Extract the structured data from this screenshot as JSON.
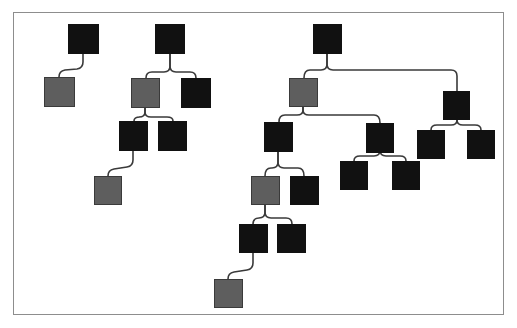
{
  "diagram": {
    "type": "tree-diagram",
    "frame": {
      "x": 13,
      "y": 12,
      "width": 491,
      "height": 303,
      "border_color": "#8d8d8d",
      "background": "#ffffff"
    },
    "colors": {
      "dark_node": "#111111",
      "gray_node": "#5e5e5e",
      "edge": "#3a3a3a",
      "canvas": "#ffffff"
    },
    "node_size": {
      "width": 30,
      "height": 30
    },
    "counts": {
      "total": 24,
      "dark": 19,
      "gray": 5,
      "trees": 3
    },
    "nodes": [
      {
        "id": "n1",
        "label": "",
        "kind": "dark",
        "x": 68,
        "y": 24,
        "w": 31,
        "h": 30,
        "tree": 1
      },
      {
        "id": "n2",
        "label": "",
        "kind": "gray",
        "x": 44,
        "y": 77,
        "w": 31,
        "h": 30,
        "tree": 1
      },
      {
        "id": "n3",
        "label": "",
        "kind": "dark",
        "x": 155,
        "y": 24,
        "w": 30,
        "h": 30,
        "tree": 2
      },
      {
        "id": "n4",
        "label": "",
        "kind": "gray",
        "x": 131,
        "y": 78,
        "w": 29,
        "h": 30,
        "tree": 2
      },
      {
        "id": "n5",
        "label": "",
        "kind": "dark",
        "x": 181,
        "y": 78,
        "w": 30,
        "h": 30,
        "tree": 2
      },
      {
        "id": "n6",
        "label": "",
        "kind": "dark",
        "x": 119,
        "y": 121,
        "w": 29,
        "h": 30,
        "tree": 2
      },
      {
        "id": "n7",
        "label": "",
        "kind": "dark",
        "x": 158,
        "y": 121,
        "w": 29,
        "h": 30,
        "tree": 2
      },
      {
        "id": "n8",
        "label": "",
        "kind": "gray",
        "x": 94,
        "y": 176,
        "w": 28,
        "h": 29,
        "tree": 2
      },
      {
        "id": "n9",
        "label": "",
        "kind": "dark",
        "x": 313,
        "y": 24,
        "w": 29,
        "h": 30,
        "tree": 3
      },
      {
        "id": "n10",
        "label": "",
        "kind": "gray",
        "x": 289,
        "y": 78,
        "w": 29,
        "h": 29,
        "tree": 3
      },
      {
        "id": "n11",
        "label": "",
        "kind": "dark",
        "x": 264,
        "y": 122,
        "w": 29,
        "h": 30,
        "tree": 3
      },
      {
        "id": "n12",
        "label": "",
        "kind": "gray",
        "x": 251,
        "y": 176,
        "w": 29,
        "h": 29,
        "tree": 3
      },
      {
        "id": "n13",
        "label": "",
        "kind": "dark",
        "x": 290,
        "y": 176,
        "w": 29,
        "h": 29,
        "tree": 3
      },
      {
        "id": "n14",
        "label": "",
        "kind": "dark",
        "x": 239,
        "y": 224,
        "w": 29,
        "h": 29,
        "tree": 3
      },
      {
        "id": "n15",
        "label": "",
        "kind": "dark",
        "x": 277,
        "y": 224,
        "w": 29,
        "h": 29,
        "tree": 3
      },
      {
        "id": "n16",
        "label": "",
        "kind": "gray",
        "x": 214,
        "y": 279,
        "w": 29,
        "h": 29,
        "tree": 3
      },
      {
        "id": "n17",
        "label": "",
        "kind": "dark",
        "x": 366,
        "y": 123,
        "w": 28,
        "h": 30,
        "tree": 3
      },
      {
        "id": "n18",
        "label": "",
        "kind": "dark",
        "x": 340,
        "y": 161,
        "w": 28,
        "h": 29,
        "tree": 3
      },
      {
        "id": "n19",
        "label": "",
        "kind": "dark",
        "x": 392,
        "y": 161,
        "w": 28,
        "h": 29,
        "tree": 3
      },
      {
        "id": "n20",
        "label": "",
        "kind": "dark",
        "x": 443,
        "y": 91,
        "w": 27,
        "h": 29,
        "tree": 3
      },
      {
        "id": "n21",
        "label": "",
        "kind": "dark",
        "x": 417,
        "y": 130,
        "w": 28,
        "h": 29,
        "tree": 3
      },
      {
        "id": "n22",
        "label": "",
        "kind": "dark",
        "x": 467,
        "y": 130,
        "w": 28,
        "h": 29,
        "tree": 3
      }
    ],
    "edges": [
      {
        "from": "n1",
        "to": "n2",
        "style": "elbow-curved"
      },
      {
        "from": "n3",
        "to": "n4",
        "style": "fork"
      },
      {
        "from": "n3",
        "to": "n5",
        "style": "fork"
      },
      {
        "from": "n4",
        "to": "n6",
        "style": "fork"
      },
      {
        "from": "n4",
        "to": "n7",
        "style": "fork"
      },
      {
        "from": "n6",
        "to": "n8",
        "style": "elbow-curved"
      },
      {
        "from": "n9",
        "to": "n10",
        "style": "fork"
      },
      {
        "from": "n9",
        "to": "n20",
        "style": "long-elbow"
      },
      {
        "from": "n10",
        "to": "n11",
        "style": "fork"
      },
      {
        "from": "n10",
        "to": "n17",
        "style": "fork"
      },
      {
        "from": "n11",
        "to": "n12",
        "style": "fork"
      },
      {
        "from": "n11",
        "to": "n13",
        "style": "fork"
      },
      {
        "from": "n12",
        "to": "n14",
        "style": "fork"
      },
      {
        "from": "n12",
        "to": "n15",
        "style": "fork"
      },
      {
        "from": "n14",
        "to": "n16",
        "style": "elbow-curved"
      },
      {
        "from": "n17",
        "to": "n18",
        "style": "fork"
      },
      {
        "from": "n17",
        "to": "n19",
        "style": "fork"
      },
      {
        "from": "n20",
        "to": "n21",
        "style": "fork"
      },
      {
        "from": "n20",
        "to": "n22",
        "style": "fork"
      }
    ]
  }
}
